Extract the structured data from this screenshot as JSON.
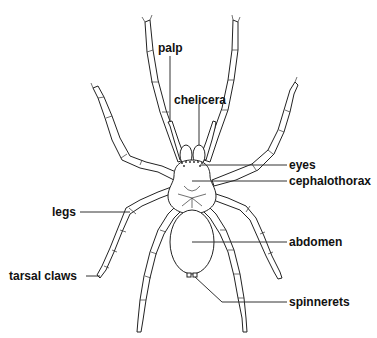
{
  "diagram": {
    "labels": {
      "palp": "palp",
      "chelicera": "chelicera",
      "eyes": "eyes",
      "cephalothorax": "cephalothorax",
      "legs": "legs",
      "abdomen": "abdomen",
      "tarsal_claws": "tarsal claws",
      "spinnerets": "spinnerets"
    },
    "colors": {
      "background": "#ffffff",
      "line": "#222222",
      "text": "#111111"
    }
  }
}
